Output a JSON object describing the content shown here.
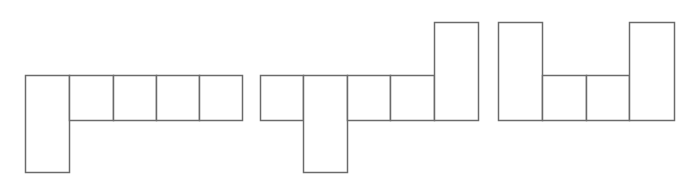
{
  "diagram": {
    "stroke_color": "#6b6b6b",
    "stroke_width": 1.5,
    "fill_color": "#ffffff",
    "background": "#ffffff",
    "unit": 44,
    "shapes": [
      {
        "id": "net-1",
        "cells": [
          {
            "x": 25,
            "y": 75,
            "w": 44,
            "h": 97
          },
          {
            "x": 69,
            "y": 75,
            "w": 44,
            "h": 45
          },
          {
            "x": 113,
            "y": 75,
            "w": 43,
            "h": 45
          },
          {
            "x": 156,
            "y": 75,
            "w": 43,
            "h": 45
          },
          {
            "x": 199,
            "y": 75,
            "w": 43,
            "h": 45
          }
        ]
      },
      {
        "id": "net-2",
        "cells": [
          {
            "x": 260,
            "y": 75,
            "w": 43,
            "h": 45
          },
          {
            "x": 303,
            "y": 75,
            "w": 44,
            "h": 97
          },
          {
            "x": 347,
            "y": 75,
            "w": 43,
            "h": 45
          },
          {
            "x": 390,
            "y": 75,
            "w": 44,
            "h": 45
          },
          {
            "x": 434,
            "y": 22,
            "w": 44,
            "h": 98
          }
        ]
      },
      {
        "id": "net-3",
        "cells": [
          {
            "x": 498,
            "y": 22,
            "w": 44,
            "h": 98
          },
          {
            "x": 542,
            "y": 75,
            "w": 44,
            "h": 45
          },
          {
            "x": 586,
            "y": 75,
            "w": 43,
            "h": 45
          },
          {
            "x": 629,
            "y": 22,
            "w": 45,
            "h": 98
          }
        ]
      }
    ]
  }
}
